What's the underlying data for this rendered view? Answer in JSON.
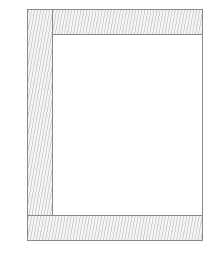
{
  "diagram": {
    "type": "page-layout-wireframe",
    "regions": [
      {
        "id": "left-column",
        "fill": "hatched"
      },
      {
        "id": "top-band",
        "fill": "hatched"
      },
      {
        "id": "content-area",
        "fill": "blank"
      },
      {
        "id": "bottom-band",
        "fill": "hatched"
      }
    ],
    "colors": {
      "border": "#8a8a8a",
      "hatch": "#969696",
      "background": "#ffffff"
    }
  }
}
